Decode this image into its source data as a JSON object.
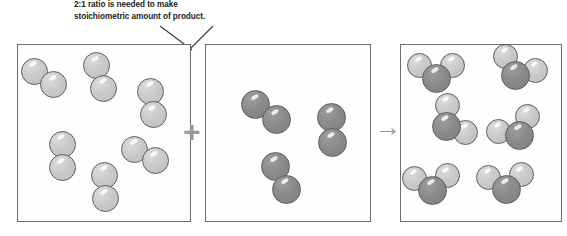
{
  "figure": {
    "background_color": "#ffffff"
  },
  "caption": {
    "text": "2:1 ratio is needed to make\nstoichiometric amount of product.",
    "line_1": "2:1 ratio is needed to make",
    "line_2": "stoichiometric amount of product.",
    "color": "#1b1b1b"
  },
  "clipped_caption": {
    "text": "limiting reagent amount of product"
  },
  "operators": {
    "plus": "+",
    "arrow": "→",
    "color": "#9a9a9a"
  },
  "palette": {
    "atom_light": "#c9c9c9",
    "atom_dark": "#8a8a8a",
    "atom_outline": "#5d5d5d",
    "box_border": "#6d6d6d",
    "leader_line": "#3a3a3a"
  },
  "boxes": [
    {
      "id": "box-reactant-1",
      "name": "hydrogen-reactant-box",
      "role": "reactant",
      "species": "H2",
      "molecule_count": 6,
      "atom_color": "light"
    },
    {
      "id": "box-reactant-2",
      "name": "oxygen-reactant-box",
      "role": "reactant",
      "species": "O2",
      "molecule_count": 3,
      "atom_color": "dark"
    },
    {
      "id": "box-product",
      "name": "water-product-box",
      "role": "product",
      "species": "H2O",
      "molecule_count": 6,
      "atom_color": "dark-center-light-ends"
    }
  ],
  "chart_data": {
    "type": "diagram",
    "title": "2:1 ratio is needed to make stoichiometric amount of product.",
    "reaction": "2 H2 + O2 -> 2 H2O",
    "categories": [
      "H2 (reactant)",
      "O2 (reactant)",
      "H2O (product)"
    ],
    "values": [
      6,
      3,
      6
    ],
    "ratio": "2:1",
    "xlabel": "",
    "ylabel": "Number of molecules",
    "legend": [
      "light atom = hydrogen",
      "dark atom = oxygen"
    ]
  },
  "molecules": {
    "hydrogen": [
      {
        "x": 44,
        "y": 78,
        "angle": 35,
        "r": 13.5
      },
      {
        "x": 100,
        "y": 77,
        "angle": 72,
        "r": 13.5
      },
      {
        "x": 152,
        "y": 103,
        "angle": 85,
        "r": 13.5
      },
      {
        "x": 62,
        "y": 156,
        "angle": 90,
        "r": 13.5
      },
      {
        "x": 145,
        "y": 155,
        "angle": 30,
        "r": 13.5
      },
      {
        "x": 105,
        "y": 187,
        "angle": 88,
        "r": 13.5
      }
    ],
    "oxygen": [
      {
        "x": 266,
        "y": 112,
        "angle": 36,
        "r": 14.5
      },
      {
        "x": 332,
        "y": 130,
        "angle": 86,
        "r": 14.5
      },
      {
        "x": 281,
        "y": 178,
        "angle": 62,
        "r": 14.5
      }
    ],
    "water": [
      {
        "x": 436,
        "y": 78,
        "angle": -90,
        "r_o": 14.5,
        "r_h": 12.5
      },
      {
        "x": 515,
        "y": 75,
        "angle": -65,
        "r_o": 14.5,
        "r_h": 12.5
      },
      {
        "x": 446,
        "y": 126,
        "angle": -35,
        "r_o": 14.5,
        "r_h": 12.5
      },
      {
        "x": 519,
        "y": 135,
        "angle": -118,
        "r_o": 14.5,
        "r_h": 12.5
      },
      {
        "x": 432,
        "y": 190,
        "angle": -95,
        "r_o": 14.5,
        "r_h": 12.5
      },
      {
        "x": 506,
        "y": 189,
        "angle": -95,
        "r_o": 14.5,
        "r_h": 12.5
      }
    ]
  },
  "leader_lines": [
    {
      "x1": 160,
      "y1": 26,
      "x2": 190,
      "y2": 50
    },
    {
      "x1": 212,
      "y1": 26,
      "x2": 189,
      "y2": 50
    }
  ]
}
